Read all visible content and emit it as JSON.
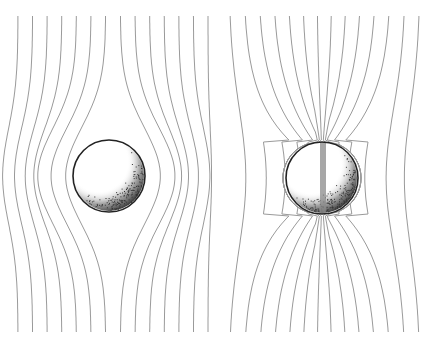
{
  "diagram": {
    "type": "field-lines-around-spheres",
    "panels": [
      {
        "id": "left",
        "description": "Uniform field deflected around a sphere (lines avoid sphere)",
        "sphere": {
          "cx": 109,
          "cy": 176,
          "r": 36
        },
        "line_count": 14,
        "x_start": 18,
        "x_end": 208,
        "mode": "repel"
      },
      {
        "id": "right",
        "description": "Field lines concentrated into a sphere with vertical rod (lines converge to poles)",
        "sphere": {
          "cx": 322,
          "cy": 178,
          "r": 36
        },
        "line_count": 14,
        "x_start": 229,
        "x_end": 420,
        "mode": "attract",
        "rod": {
          "x": 320,
          "width": 6
        }
      }
    ],
    "colors": {
      "field_line": "#9a9a9a",
      "sphere_outline": "#222222",
      "shading": "#333333",
      "rod": "#8a8a8a",
      "background": "#ffffff"
    },
    "y_top": 16,
    "y_bottom": 332
  }
}
